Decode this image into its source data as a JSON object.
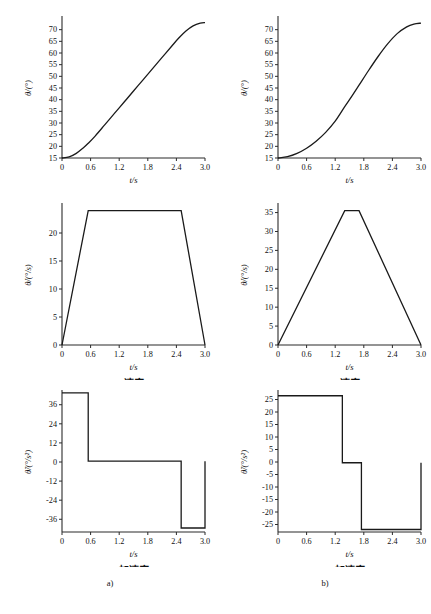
{
  "figure": {
    "columns": [
      {
        "key": "a",
        "label": "a)"
      },
      {
        "key": "b",
        "label": "b)"
      }
    ],
    "row_captions": {
      "position": "位置",
      "velocity": "速度",
      "acceleration": "加速度"
    },
    "axis": {
      "xlabel": "t/s",
      "ylabel_position": "θ/(°)",
      "ylabel_velocity": "θ̇/(°/s)",
      "ylabel_acceleration": "θ̈/(°/s²)"
    }
  },
  "chart_data": [
    {
      "id": "a-position",
      "type": "line",
      "title": "位置",
      "xlabel": "t/s",
      "ylabel": "θ/(°)",
      "xlim": [
        0,
        3.0
      ],
      "ylim": [
        15,
        75
      ],
      "xticks": [
        0,
        0.6,
        1.2,
        1.8,
        2.4,
        3.0
      ],
      "xticklabels": [
        "0",
        "0.6",
        "1.2",
        "1.8",
        "2.4",
        "3.0"
      ],
      "yticks": [
        15,
        20,
        25,
        30,
        35,
        40,
        45,
        50,
        55,
        60,
        65,
        70
      ],
      "yticklabels": [
        "15",
        "20",
        "25",
        "30",
        "35",
        "40",
        "45",
        "50",
        "55",
        "60",
        "65",
        "70"
      ],
      "grid": false,
      "legend": "none",
      "x": [
        0,
        0.15,
        0.3,
        0.45,
        0.55,
        0.7,
        0.9,
        1.1,
        1.3,
        1.5,
        1.7,
        1.9,
        2.1,
        2.3,
        2.45,
        2.6,
        2.75,
        2.9,
        3.0
      ],
      "y": [
        15.0,
        15.5,
        17.0,
        19.4,
        21.3,
        24.5,
        29.3,
        34.1,
        38.9,
        43.7,
        48.5,
        53.3,
        58.1,
        62.9,
        66.4,
        69.4,
        71.6,
        72.8,
        73.0
      ]
    },
    {
      "id": "b-position",
      "type": "line",
      "title": "位置",
      "xlabel": "t/s",
      "ylabel": "θ/(°)",
      "xlim": [
        0,
        3.0
      ],
      "ylim": [
        15,
        75
      ],
      "xticks": [
        0,
        0.6,
        1.2,
        1.8,
        2.4,
        3.0
      ],
      "xticklabels": [
        "0",
        "0.6",
        "1.2",
        "1.8",
        "2.4",
        "3.0"
      ],
      "yticks": [
        15,
        20,
        25,
        30,
        35,
        40,
        45,
        50,
        55,
        60,
        65,
        70
      ],
      "yticklabels": [
        "15",
        "20",
        "25",
        "30",
        "35",
        "40",
        "45",
        "50",
        "55",
        "60",
        "65",
        "70"
      ],
      "grid": false,
      "legend": "none",
      "x": [
        0,
        0.2,
        0.4,
        0.6,
        0.8,
        1.0,
        1.2,
        1.4,
        1.55,
        1.7,
        1.9,
        2.1,
        2.3,
        2.5,
        2.7,
        2.85,
        3.0
      ],
      "y": [
        15.0,
        15.6,
        17.0,
        19.2,
        22.2,
        26.0,
        30.8,
        37.0,
        41.5,
        46.2,
        52.5,
        58.5,
        63.9,
        68.3,
        71.2,
        72.4,
        72.8
      ]
    },
    {
      "id": "a-velocity",
      "type": "line",
      "title": "速度",
      "xlabel": "t/s",
      "ylabel": "θ̇/(°/s)",
      "xlim": [
        0,
        3.0
      ],
      "ylim": [
        0,
        25
      ],
      "xticks": [
        0,
        0.6,
        1.2,
        1.8,
        2.4,
        3.0
      ],
      "xticklabels": [
        "0",
        "0.6",
        "1.2",
        "1.8",
        "2.4",
        "3.0"
      ],
      "yticks": [
        0,
        5,
        10,
        15,
        20
      ],
      "yticklabels": [
        "0",
        "5",
        "10",
        "15",
        "20"
      ],
      "grid": false,
      "legend": "none",
      "profile": "trapezoidal",
      "peak_value": 24.0,
      "x": [
        0,
        0.55,
        2.5,
        3.0
      ],
      "y": [
        0,
        24.0,
        24.0,
        0
      ]
    },
    {
      "id": "b-velocity",
      "type": "line",
      "title": "速度",
      "xlabel": "t/s",
      "ylabel": "θ̇/(°/s)",
      "xlim": [
        0,
        3.0
      ],
      "ylim": [
        0,
        37
      ],
      "xticks": [
        0,
        0.6,
        1.2,
        1.8,
        2.4,
        3.0
      ],
      "xticklabels": [
        "0",
        "0.6",
        "1.2",
        "1.8",
        "2.4",
        "3.0"
      ],
      "yticks": [
        0,
        5,
        10,
        15,
        20,
        25,
        30,
        35
      ],
      "yticklabels": [
        "0",
        "5",
        "10",
        "15",
        "20",
        "25",
        "30",
        "35"
      ],
      "grid": false,
      "legend": "none",
      "profile": "triangular",
      "peak_value": 35.5,
      "x": [
        0,
        1.4,
        1.7,
        3.0
      ],
      "y": [
        0,
        35.5,
        35.5,
        0
      ]
    },
    {
      "id": "a-acceleration",
      "type": "line",
      "title": "加速度",
      "xlabel": "t/s",
      "ylabel": "θ̈/(°/s²)",
      "xlim": [
        0,
        3.0
      ],
      "ylim": [
        -44,
        44
      ],
      "xticks": [
        0,
        0.6,
        1.2,
        1.8,
        2.4,
        3.0
      ],
      "xticklabels": [
        "0",
        "0.6",
        "1.2",
        "1.8",
        "2.4",
        "3.0"
      ],
      "yticks": [
        36,
        24,
        12,
        0,
        -12,
        -24,
        -36
      ],
      "yticklabels": [
        "36",
        "24",
        "12",
        "0",
        "-12",
        "-24",
        "-36"
      ],
      "grid": false,
      "legend": "none",
      "profile": "step",
      "segments": [
        {
          "t_start": 0,
          "t_end": 0.55,
          "value": 43.5
        },
        {
          "t_start": 0.55,
          "t_end": 2.5,
          "value": 0.5
        },
        {
          "t_start": 2.5,
          "t_end": 3.0,
          "value": -41.5
        },
        {
          "t_start": 3.0,
          "t_end": 3.05,
          "value": 0.5
        }
      ]
    },
    {
      "id": "b-acceleration",
      "type": "line",
      "title": "加速度",
      "xlabel": "t/s",
      "ylabel": "θ̈/(°/s²)",
      "xlim": [
        0,
        3.0
      ],
      "ylim": [
        -28,
        28
      ],
      "xticks": [
        0,
        0.6,
        1.2,
        1.8,
        2.4,
        3.0
      ],
      "xticklabels": [
        "0",
        "0.6",
        "1.2",
        "1.8",
        "2.4",
        "3.0"
      ],
      "yticks": [
        25,
        20,
        15,
        10,
        5,
        0,
        -5,
        -10,
        -15,
        -20,
        -25
      ],
      "yticklabels": [
        "25",
        "20",
        "15",
        "10",
        "5",
        "0",
        "-5",
        "-10",
        "-15",
        "-20",
        "-25"
      ],
      "grid": false,
      "legend": "none",
      "profile": "step",
      "segments": [
        {
          "t_start": 0,
          "t_end": 1.35,
          "value": 26.5
        },
        {
          "t_start": 1.35,
          "t_end": 1.75,
          "value": -0.3
        },
        {
          "t_start": 1.75,
          "t_end": 3.0,
          "value": -27.0
        },
        {
          "t_start": 3.0,
          "t_end": 3.05,
          "value": -0.3
        }
      ]
    }
  ]
}
